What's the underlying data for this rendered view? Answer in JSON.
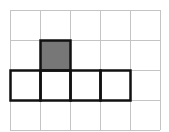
{
  "diagram": {
    "type": "grid-shape",
    "rows": 4,
    "cols": 5,
    "cell_size": 30,
    "origin": [
      10,
      10
    ],
    "grid_color": "#c4c4c4",
    "outline_color": "#111111",
    "fill_color": "#777777",
    "shaded_cells": [
      [
        1,
        1
      ]
    ],
    "outlined_cells": [
      [
        1,
        1
      ],
      [
        2,
        0
      ],
      [
        2,
        1
      ],
      [
        2,
        2
      ],
      [
        2,
        3
      ]
    ]
  }
}
